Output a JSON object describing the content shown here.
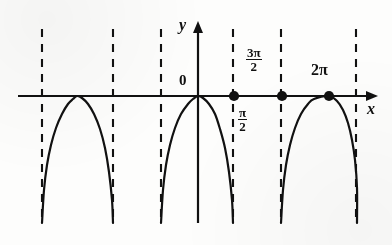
{
  "figure": {
    "title": "",
    "axis_labels": {
      "x": "x",
      "y": "y"
    },
    "origin_label": "0",
    "point_labels": [
      {
        "name": "pi-over-2",
        "numerator": "π",
        "denominator": "2"
      },
      {
        "name": "three-pi-over-2",
        "numerator": "3π",
        "denominator": "2"
      },
      {
        "name": "two-pi",
        "text": "2π"
      }
    ],
    "colors": {
      "ink": "#111111",
      "paper": "#fdfdfc"
    }
  },
  "chart_data": {
    "type": "line",
    "title": "",
    "xlabel": "x",
    "ylabel": "y",
    "grid": false,
    "legend": null,
    "xlim": [
      -4.71238898038469,
      6.544984694978736
    ],
    "ylim": [
      -8.5,
      1.0
    ],
    "xticks": [
      1.5707963267948966,
      4.71238898038469,
      6.283185307179586
    ],
    "xticklabels": [
      "π/2",
      "3π/2",
      "2π"
    ],
    "yticks": [],
    "yticklabels": [],
    "annotations": [
      {
        "text": "0",
        "x": -0.28,
        "y": 0.62,
        "note": "origin label left of y-axis"
      },
      {
        "text": "π/2",
        "x": 1.93,
        "y": -1.9,
        "note": "stacked fraction below axis"
      },
      {
        "text": "3π/2",
        "x": 4.16,
        "y": 2.55,
        "note": "stacked fraction above axis"
      },
      {
        "text": "2π",
        "x": 6.28,
        "y": 1.45,
        "note": "above axis at vertex"
      },
      {
        "text": "y",
        "x": -0.33,
        "y": 5.25
      },
      {
        "text": "x",
        "x": 7.2,
        "y": -0.95
      }
    ],
    "series": [
      {
        "name": "branch-left",
        "equation": "y = -tan^2-like arch with vertex on x-axis",
        "domain": [
          -4.71238898038469,
          -1.5707963267948966
        ],
        "vertex": [
          -3.141592653589793,
          0
        ],
        "points_px": [
          [
            42,
            223
          ],
          [
            44,
            190
          ],
          [
            47,
            165
          ],
          [
            51,
            145
          ],
          [
            56,
            128
          ],
          [
            62,
            114
          ],
          [
            68,
            104
          ],
          [
            73,
            99
          ],
          [
            77,
            96
          ],
          [
            82,
            98
          ],
          [
            88,
            104
          ],
          [
            94,
            114
          ],
          [
            100,
            129
          ],
          [
            105,
            148
          ],
          [
            109,
            172
          ],
          [
            112,
            200
          ],
          [
            113,
            223
          ]
        ]
      },
      {
        "name": "branch-middle",
        "equation": "y = -tan^2-like arch with vertex on x-axis",
        "domain": [
          -1.5707963267948966,
          1.5707963267948966
        ],
        "vertex": [
          0,
          0
        ],
        "points_px": [
          [
            161,
            223
          ],
          [
            163,
            190
          ],
          [
            166,
            165
          ],
          [
            170,
            145
          ],
          [
            175,
            128
          ],
          [
            181,
            114
          ],
          [
            188,
            104
          ],
          [
            193,
            99
          ],
          [
            198,
            96
          ],
          [
            203,
            98
          ],
          [
            209,
            104
          ],
          [
            215,
            114
          ],
          [
            220,
            129
          ],
          [
            225,
            148
          ],
          [
            229,
            172
          ],
          [
            232,
            200
          ],
          [
            233,
            223
          ]
        ]
      },
      {
        "name": "branch-right",
        "equation": "y = -tan^2-like arch with vertex on x-axis",
        "domain": [
          4.71238898038469,
          7.853981633974483
        ],
        "vertex": [
          6.283185307179586,
          0
        ],
        "points_px": [
          [
            281,
            223
          ],
          [
            283,
            190
          ],
          [
            286,
            165
          ],
          [
            290,
            145
          ],
          [
            295,
            128
          ],
          [
            301,
            114
          ],
          [
            308,
            104
          ],
          [
            314,
            99
          ],
          [
            329,
            96
          ],
          [
            337,
            101
          ],
          [
            343,
            110
          ],
          [
            348,
            123
          ],
          [
            352,
            140
          ],
          [
            355,
            160
          ],
          [
            357,
            188
          ],
          [
            357,
            223
          ]
        ]
      }
    ],
    "asymptotes": [
      {
        "name": "asymptote-neg-3pi-2",
        "x": -4.71238898038469,
        "x_px": 42,
        "style": "dashed"
      },
      {
        "name": "asymptote-neg-pi-2",
        "x": -1.5707963267948966,
        "x_px": 113,
        "style": "dashed"
      },
      {
        "name": "asymptote-neg-pi-2-b",
        "x": -1.5707963267948966,
        "x_px": 161,
        "style": "dashed"
      },
      {
        "name": "asymptote-pi-2",
        "x": 1.5707963267948966,
        "x_px": 233,
        "style": "dashed"
      },
      {
        "name": "asymptote-3pi-2",
        "x": 4.71238898038469,
        "x_px": 281,
        "style": "dashed"
      },
      {
        "name": "asymptote-5pi-2",
        "x": 7.853981633974483,
        "x_px": 356,
        "style": "dashed"
      }
    ],
    "points": [
      {
        "name": "point-pi-over-2",
        "x": 1.5707963267948966,
        "y": 0,
        "x_px": 234,
        "y_px": 96,
        "filled": true
      },
      {
        "name": "point-3pi-over-2",
        "x": 4.71238898038469,
        "y": 0,
        "x_px": 282,
        "y_px": 96,
        "filled": true
      },
      {
        "name": "point-2pi",
        "x": 6.283185307179586,
        "y": 0,
        "x_px": 329,
        "y_px": 96,
        "filled": true
      }
    ],
    "axes_px": {
      "x_axis_y": 96,
      "y_axis_x": 198,
      "x_axis_from": 18,
      "x_axis_to": 378,
      "y_axis_from": 22,
      "y_axis_to": 223
    }
  }
}
